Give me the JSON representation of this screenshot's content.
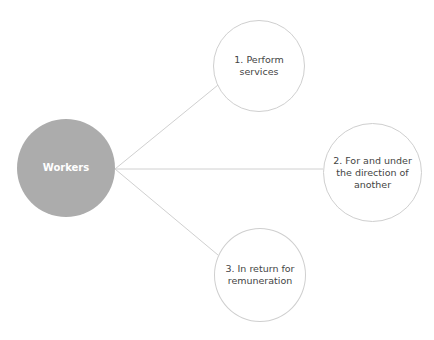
{
  "diagram": {
    "center": {
      "label": "Workers",
      "fill": "#acacac"
    },
    "nodes": [
      {
        "label": "1. Perform services"
      },
      {
        "label": "2. For and under the direction of another"
      },
      {
        "label": "3. In return for remuneration"
      }
    ]
  }
}
